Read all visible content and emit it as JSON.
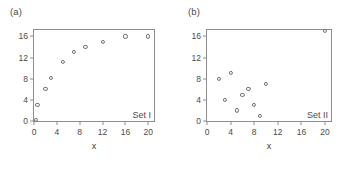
{
  "figure": {
    "background": "#ffffff",
    "marker_color": "#6e6e78",
    "axis_color": "#8e8e8e",
    "text_color": "#3a3a3a"
  },
  "panels": [
    {
      "key": "a",
      "label": "(a)",
      "set_label": "Set I",
      "xlabel": "x",
      "ylabel": "",
      "xticks": [
        0,
        4,
        8,
        12,
        16,
        20
      ],
      "yticks": [
        0,
        4,
        8,
        12,
        16
      ],
      "xlim": [
        0,
        21
      ],
      "ylim": [
        0,
        17.2
      ]
    },
    {
      "key": "b",
      "label": "(b)",
      "set_label": "Set II",
      "xlabel": "x",
      "ylabel": "",
      "xticks": [
        0,
        4,
        8,
        12,
        16,
        20
      ],
      "yticks": [
        0,
        4,
        8,
        12,
        16
      ],
      "xlim": [
        0,
        21
      ],
      "ylim": [
        0,
        17.2
      ]
    }
  ],
  "chart_data": [
    {
      "type": "scatter",
      "panel": "(a)",
      "title": "Set I",
      "xlabel": "x",
      "ylabel": "",
      "xlim": [
        0,
        21
      ],
      "ylim": [
        0,
        17.2
      ],
      "xticks": [
        0,
        4,
        8,
        12,
        16,
        20
      ],
      "yticks": [
        0,
        4,
        8,
        12,
        16
      ],
      "grid": false,
      "legend": "none",
      "marker": "open-circle",
      "series": [
        {
          "name": "Set I",
          "x": [
            0.4,
            0.6,
            2.0,
            3.0,
            5.0,
            7.0,
            9.0,
            12.0,
            16.0,
            20.0
          ],
          "y": [
            0.2,
            3.0,
            6.0,
            8.1,
            11.1,
            13.0,
            14.0,
            15.0,
            16.0,
            16.0
          ]
        }
      ]
    },
    {
      "type": "scatter",
      "panel": "(b)",
      "title": "Set II",
      "xlabel": "x",
      "ylabel": "",
      "xlim": [
        0,
        21
      ],
      "ylim": [
        0,
        17.2
      ],
      "xticks": [
        0,
        4,
        8,
        12,
        16,
        20
      ],
      "yticks": [
        0,
        4,
        8,
        12,
        16
      ],
      "grid": false,
      "legend": "none",
      "marker": "open-circle",
      "series": [
        {
          "name": "Set II",
          "x": [
            2.0,
            3.0,
            4.0,
            5.0,
            6.0,
            7.0,
            8.0,
            9.0,
            10.0,
            20.0
          ],
          "y": [
            8.0,
            4.0,
            9.1,
            2.0,
            5.0,
            6.1,
            3.0,
            1.0,
            7.0,
            17.0
          ]
        }
      ]
    }
  ]
}
